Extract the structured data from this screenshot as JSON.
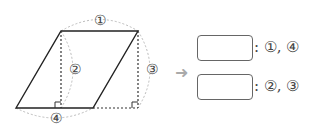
{
  "diagram": {
    "shape": "parallelogram",
    "markers": {
      "m1": "①",
      "m2": "②",
      "m3": "③",
      "m4": "④"
    },
    "colors": {
      "line": "#222222",
      "dotted": "#333333",
      "arc": "#bbbbbb",
      "text": "#444444",
      "arrow": "#aaaaaa"
    }
  },
  "answers": [
    {
      "box_value": "",
      "label": ": ①, ④"
    },
    {
      "box_value": "",
      "label": ": ②, ③"
    }
  ],
  "arrow": "➜"
}
